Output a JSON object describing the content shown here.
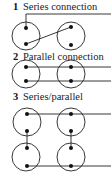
{
  "sections": [
    {
      "number": "1",
      "title": "Series connection"
    },
    {
      "number": "2",
      "title": "Parallel connection"
    },
    {
      "number": "3",
      "title": "Series/parallel"
    }
  ],
  "colors": {
    "stroke": "#222222",
    "text": "#222222",
    "background": "#ffffff"
  }
}
